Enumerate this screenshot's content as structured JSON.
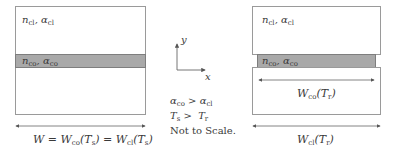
{
  "left_panel": {
    "cladding_label": {
      "n": "n",
      "n_sub": "cl",
      "sep": ", ",
      "a": "α",
      "a_sub": "cl"
    },
    "core_label": {
      "n": "n",
      "n_sub": "co",
      "sep": ", ",
      "a": "α",
      "a_sub": "co"
    },
    "width_label": {
      "w": "W",
      "eq1": " = ",
      "w1": "W",
      "w1_sub": "co",
      "arg1": "(T",
      "arg1_sub": "s",
      "close1": ")",
      "eq2": " = ",
      "w2": "W",
      "w2_sub": "cl",
      "arg2": "(T",
      "arg2_sub": "s",
      "close2": ")"
    }
  },
  "axes": {
    "y_label": "y",
    "x_label": "x"
  },
  "notes": {
    "line1": {
      "a1": "α",
      "a1_sub": "co",
      "op": " > ",
      "a2": "α",
      "a2_sub": "cl"
    },
    "line2": {
      "t1": "T",
      "t1_sub": "s",
      "op": " >  ",
      "t2": "T",
      "t2_sub": "r"
    },
    "line3": "Not to Scale."
  },
  "right_panel": {
    "cladding_label": {
      "n": "n",
      "n_sub": "cl",
      "sep": ", ",
      "a": "α",
      "a_sub": "cl"
    },
    "core_label": {
      "n": "n",
      "n_sub": "co",
      "sep": ", ",
      "a": "α",
      "a_sub": "co"
    },
    "core_width_label": {
      "w": "W",
      "w_sub": "co",
      "arg": "(T",
      "arg_sub": "r",
      "close": ")"
    },
    "clad_width_label": {
      "w": "W",
      "w_sub": "cl",
      "arg": "(T",
      "arg_sub": "r",
      "close": ")"
    }
  },
  "colors": {
    "core_fill": "#a9a9a9",
    "outline": "#9a9a9a",
    "arrow": "#555555"
  }
}
